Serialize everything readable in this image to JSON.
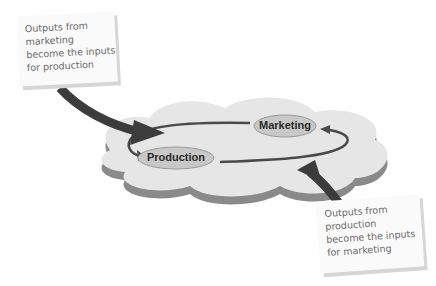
{
  "diagram": {
    "nodes": [
      {
        "id": "marketing",
        "label": "Marketing"
      },
      {
        "id": "production",
        "label": "Production"
      }
    ],
    "notes": [
      {
        "id": "note-marketing-to-production",
        "lines": [
          "Outputs from",
          "marketing",
          "become the inputs",
          "for production"
        ]
      },
      {
        "id": "note-production-to-marketing",
        "lines": [
          "Outputs from",
          "production",
          "become the inputs",
          "for marketing"
        ]
      }
    ],
    "edges": [
      {
        "from": "marketing",
        "to": "production",
        "style": "curved-arrow"
      },
      {
        "from": "production",
        "to": "marketing",
        "style": "curved-arrow"
      }
    ],
    "colors": {
      "cloud_fill": "#e6e6e6",
      "cloud_shadow": "#8a8a8a",
      "node_fill": "#c8c8c8",
      "cycle_stroke": "#4a4a4a",
      "big_arrow": "#3c3c3c"
    }
  }
}
